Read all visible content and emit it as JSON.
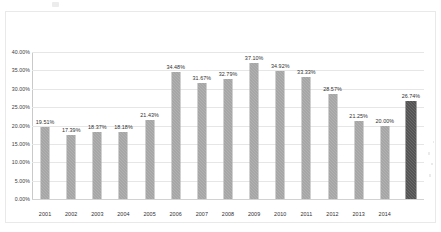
{
  "figure": {
    "background_color": "#ffffff",
    "frame_color": "#e9e9e9",
    "bar_color": "#9b9b9b",
    "highlight_bar_color": "#3f3f3f",
    "gridline_color": "#e6e6e6"
  },
  "chart_data": {
    "type": "bar",
    "title": "",
    "subtitle": "",
    "xlabel": "",
    "ylabel": "",
    "categories": [
      "2001",
      "2002",
      "2003",
      "2004",
      "2005",
      "2006",
      "2007",
      "2008",
      "2009",
      "2010",
      "2011",
      "2012",
      "2013",
      "2014",
      ""
    ],
    "values": [
      19.51,
      17.39,
      18.37,
      18.18,
      21.43,
      34.48,
      31.67,
      32.79,
      37.1,
      34.92,
      33.33,
      28.57,
      21.25,
      20.0,
      26.74
    ],
    "data_labels": [
      "19.51%",
      "17.39%",
      "18.37%",
      "18.18%",
      "21.43%",
      "34.48%",
      "31.67%",
      "32.79%",
      "37.10%",
      "34.92%",
      "33.33%",
      "28.57%",
      "21.25%",
      "20.00%",
      "26.74%"
    ],
    "bar_styles": [
      "normal",
      "normal",
      "normal",
      "normal",
      "normal",
      "normal",
      "normal",
      "normal",
      "normal",
      "normal",
      "normal",
      "normal",
      "normal",
      "normal",
      "highlight"
    ],
    "ylim": [
      0,
      40
    ],
    "ytick_values": [
      40,
      35,
      30,
      25,
      20,
      15,
      10,
      5,
      0
    ],
    "ytick_labels": [
      "40.00%",
      "35.00%",
      "30.00%",
      "25.00%",
      "20.00%",
      "15.00%",
      "10.00%",
      "5.00%",
      "0.00%"
    ],
    "xtick_labels": [
      "2001",
      "2002",
      "2003",
      "2004",
      "2005",
      "2006",
      "2007",
      "2008",
      "2009",
      "2010",
      "2011",
      "2012",
      "2013",
      "2014"
    ],
    "grid": true,
    "grid_axis": "y",
    "legend": null,
    "legend_position": "none",
    "annotations": []
  }
}
